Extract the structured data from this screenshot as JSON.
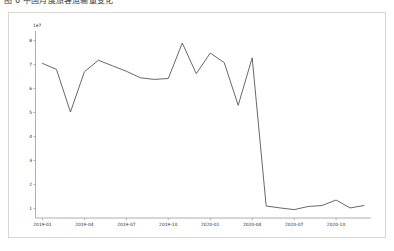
{
  "document": {
    "heading": "图 6 中国月度旅客运输量变化"
  },
  "card": {
    "border_color": "#d7d7d7",
    "background": "#ffffff"
  },
  "chart_data": {
    "type": "line",
    "title": "",
    "subtitle": "",
    "xlabel": "",
    "ylabel": "",
    "offset_text": "1e7",
    "grid": false,
    "legend": null,
    "legend_position": "none",
    "line_color": "#4d4d4d",
    "xlim": [
      "2018-12",
      "2021-01"
    ],
    "ylim": [
      0.6,
      8.4
    ],
    "yticks": [
      1,
      2,
      3,
      4,
      5,
      6,
      7,
      8
    ],
    "ytick_labels": [
      "1",
      "2",
      "3",
      "4",
      "5",
      "6",
      "7",
      "8"
    ],
    "xticks": [
      "2019-01",
      "2019-04",
      "2019-07",
      "2019-10",
      "2020-01",
      "2020-04",
      "2020-07",
      "2020-10"
    ],
    "xtick_labels": [
      "2019-01",
      "2019-04",
      "2019-07",
      "2019-10",
      "2020-01",
      "2020-04",
      "2020-07",
      "2020-10"
    ],
    "x": [
      "2019-01",
      "2019-02",
      "2019-03",
      "2019-04",
      "2019-05",
      "2019-06",
      "2019-07",
      "2019-08",
      "2019-09",
      "2019-10",
      "2019-11",
      "2019-12",
      "2020-01",
      "2020-02",
      "2020-03",
      "2020-04",
      "2020-05",
      "2020-06",
      "2020-07",
      "2020-08",
      "2020-09",
      "2020-10",
      "2020-11",
      "2020-12"
    ],
    "series": [
      {
        "name": "passenger_volume",
        "units": "1e7",
        "values": [
          7.05,
          6.8,
          5.02,
          6.7,
          7.18,
          6.95,
          6.72,
          6.45,
          6.38,
          6.42,
          7.9,
          6.62,
          7.48,
          7.08,
          5.3,
          7.28,
          1.1,
          1.02,
          0.95,
          1.08,
          1.12,
          1.35,
          1.02,
          1.12
        ]
      }
    ]
  }
}
